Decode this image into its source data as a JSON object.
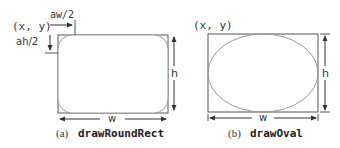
{
  "panels": [
    {
      "id": "a",
      "origin_label": "(x, y)",
      "arc_width_label": "aw/2",
      "arc_height_label": "ah/2",
      "width_label": "w",
      "height_label": "h",
      "caption_prefix": "(a)",
      "caption_method": "drawRoundRect"
    },
    {
      "id": "b",
      "origin_label": "(x, y)",
      "width_label": "w",
      "height_label": "h",
      "caption_prefix": "(b)",
      "caption_method": "drawOval"
    }
  ],
  "colors": {
    "line": "#444444",
    "shape": "#999999",
    "text": "#333333"
  }
}
